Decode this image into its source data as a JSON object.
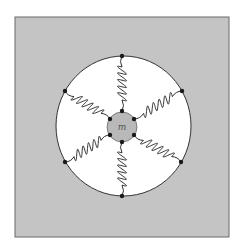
{
  "figure": {
    "background_color": "#c4c4c4",
    "frame_color": "#6a6a6a",
    "ring_fill": "#ffffff",
    "ring_stroke": "#333333",
    "mass_fill": "#b9b9b9",
    "spring_color": "#1a1a1a",
    "dot_color": "#1a1a1a",
    "mass_label": "m",
    "spring_count": 6,
    "springs": [
      {
        "name": "top",
        "outer": [
          122,
          56
        ],
        "inner": [
          122,
          111
        ]
      },
      {
        "name": "upper-right",
        "outer": [
          182,
          91
        ],
        "inner": [
          134,
          119
        ]
      },
      {
        "name": "lower-right",
        "outer": [
          181,
          162
        ],
        "inner": [
          134,
          135
        ]
      },
      {
        "name": "bottom",
        "outer": [
          122,
          196
        ],
        "inner": [
          122,
          142
        ]
      },
      {
        "name": "lower-left",
        "outer": [
          65,
          162
        ],
        "inner": [
          110,
          135
        ]
      },
      {
        "name": "upper-left",
        "outer": [
          65,
          91
        ],
        "inner": [
          110,
          119
        ]
      }
    ]
  },
  "caption": ""
}
